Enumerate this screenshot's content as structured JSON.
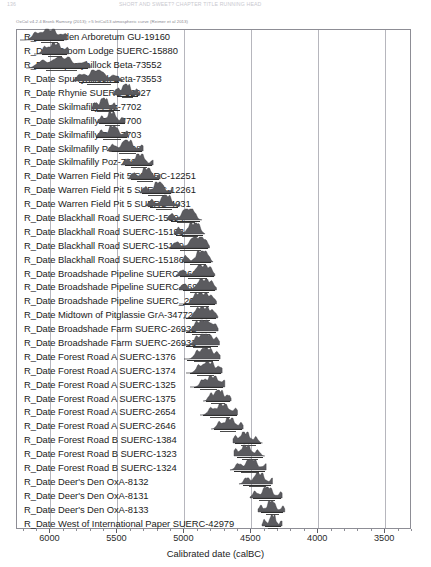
{
  "running_header": {
    "left": "136",
    "center": "SHORT AND SWEET? CHAPTER TITLE RUNNING HEAD"
  },
  "caption": "OxCal v4.2.4 Bronk Ramsey (2013); r:5 IntCal13 atmospheric curve (Reimer et al 2013)",
  "axis": {
    "title": "Calibrated date (calBC)",
    "tick_labels": [
      "6000",
      "5500",
      "5000",
      "4500",
      "4000",
      "3500"
    ],
    "min": 6250,
    "max": 3300,
    "direction": "descending"
  },
  "chart_data": {
    "type": "bar",
    "xlabel": "Calibrated date (calBC)",
    "ylabel": "",
    "xlim": [
      6250,
      3300
    ],
    "grid": true,
    "legend": "none",
    "categories": [
      "R_Date Aden Arboretum GU-19160",
      "R_Date Broom Lodge SUERC-15880",
      "R_Date Spurryhillock Beta-73552",
      "R_Date Spurryhillock Beta-73553",
      "R_Date Rhynie SUERC-52927",
      "R_Date Skilmafilly Poz-7702",
      "R_Date Skilmafilly Poz-7700",
      "R_Date Skilmafilly Poz-7703",
      "R_Date Skilmafilly Poz-7701",
      "R_Date Skilmafilly Poz-7698",
      "R_Date Skilmafilly Poz-7699",
      "R_Date Warren Field Pit 5 SUERC-12251",
      "R_Date Warren Field Pit 5 SUERC-12261",
      "R_Date Warren Field Pit 5 SUERC-4031",
      "R_Date Blackhall Road SUERC-15194",
      "R_Date Blackhall Road SUERC-15193",
      "R_Date Blackhall Road SUERC-15189",
      "R_Date Blackhall Road SUERC-15186",
      "R_Date Broadshade Pipeline SUERC-26932",
      "R_Date Broadshade Pipeline SUERC-26933",
      "R_Date Broadshade Pipeline SUERC_26934",
      "R_Date Midtown of Pitglassie GrA-34772",
      "R_Date Broadshade Farm SUERC-26932",
      "R_Date Broadshade Farm SUERC-26933",
      "R_Date Forest Road A SUERC-1376",
      "R_Date Forest Road A SUERC-1374",
      "R_Date Forest Road A SUERC-1325",
      "R_Date Forest Road A SUERC-1375",
      "R_Date Forest Road A SUERC-2654",
      "R_Date Forest Road A SUERC-2646",
      "R_Date Forest Road B SUERC-1384",
      "R_Date Forest Road B SUERC-1323",
      "R_Date Forest Road B SUERC-1324",
      "R_Date Deer's Den OxA-8132",
      "R_Date Deer's Den OxA-8131",
      "R_Date Deer's Den OxA-8133",
      "R_Date West of International Paper SUERC-42979"
    ],
    "distributions": [
      {
        "label": "R_Date Aden Arboretum GU-19160",
        "peak": 6010,
        "lo": 6230,
        "hi": 5880,
        "bar_lo": 6120,
        "bar_hi": 5900
      },
      {
        "label": "R_Date Broom Lodge SUERC-15880",
        "peak": 5960,
        "lo": 6120,
        "hi": 5860,
        "bar_lo": 6060,
        "bar_hi": 5880
      },
      {
        "label": "R_Date Spurryhillock Beta-73552",
        "peak": 5910,
        "lo": 6180,
        "hi": 5700,
        "bar_lo": 6120,
        "bar_hi": 5720
      },
      {
        "label": "R_Date Spurryhillock Beta-73553",
        "peak": 5650,
        "lo": 5830,
        "hi": 5460,
        "bar_lo": 5790,
        "bar_hi": 5490
      },
      {
        "label": "R_Date Rhynie SUERC-52927",
        "peak": 5430,
        "lo": 5530,
        "hi": 5330,
        "bar_lo": 5500,
        "bar_hi": 5350
      },
      {
        "label": "R_Date Skilmafilly Poz-7702",
        "peak": 5600,
        "lo": 5690,
        "hi": 5500,
        "bar_lo": 5700,
        "bar_hi": 5480
      },
      {
        "label": "R_Date Skilmafilly Poz-7700",
        "peak": 5540,
        "lo": 5650,
        "hi": 5440,
        "bar_lo": 5640,
        "bar_hi": 5440
      },
      {
        "label": "R_Date Skilmafilly Poz-7703",
        "peak": 5530,
        "lo": 5660,
        "hi": 5420,
        "bar_lo": 5660,
        "bar_hi": 5430
      },
      {
        "label": "R_Date Skilmafilly Poz-7698",
        "peak": 5430,
        "lo": 5580,
        "hi": 5310,
        "bar_lo": 5540,
        "bar_hi": 5320
      },
      {
        "label": "R_Date Skilmafilly Poz-7699",
        "peak": 5330,
        "lo": 5470,
        "hi": 5230,
        "bar_lo": 5440,
        "bar_hi": 5240
      },
      {
        "label": "R_Date Warren Field Pit 5 SUERC-12251",
        "peak": 5280,
        "lo": 5420,
        "hi": 5180,
        "bar_lo": 5400,
        "bar_hi": 5190
      },
      {
        "label": "R_Date Warren Field Pit 5 SUERC-12261",
        "peak": 5190,
        "lo": 5330,
        "hi": 5090,
        "bar_lo": 5320,
        "bar_hi": 5100
      },
      {
        "label": "R_Date Warren Field Pit 5 SUERC-4031",
        "peak": 5140,
        "lo": 5290,
        "hi": 5040,
        "bar_lo": 5260,
        "bar_hi": 5050
      },
      {
        "label": "R_Date Blackhall Road SUERC-15194",
        "peak": 4980,
        "lo": 5130,
        "hi": 4870,
        "bar_lo": 5100,
        "bar_hi": 4880
      },
      {
        "label": "R_Date Blackhall Road SUERC-15193",
        "peak": 4940,
        "lo": 5080,
        "hi": 4850,
        "bar_lo": 5060,
        "bar_hi": 4860
      },
      {
        "label": "R_Date Blackhall Road SUERC-15189",
        "peak": 4910,
        "lo": 5120,
        "hi": 4810,
        "bar_lo": 5090,
        "bar_hi": 4820
      },
      {
        "label": "R_Date Blackhall Road SUERC-15186",
        "peak": 4880,
        "lo": 5020,
        "hi": 4790,
        "bar_lo": 5000,
        "bar_hi": 4800
      },
      {
        "label": "R_Date Broadshade Pipeline SUERC-26932",
        "peak": 4870,
        "lo": 5060,
        "hi": 4770,
        "bar_lo": 5030,
        "bar_hi": 4780
      },
      {
        "label": "R_Date Broadshade Pipeline SUERC-26933",
        "peak": 4860,
        "lo": 5040,
        "hi": 4760,
        "bar_lo": 5010,
        "bar_hi": 4770
      },
      {
        "label": "R_Date Broadshade Pipeline SUERC_26934",
        "peak": 4860,
        "lo": 5040,
        "hi": 4760,
        "bar_lo": 5010,
        "bar_hi": 4770
      },
      {
        "label": "R_Date Midtown of Pitglassie GrA-34772",
        "peak": 4850,
        "lo": 5010,
        "hi": 4750,
        "bar_lo": 4990,
        "bar_hi": 4760
      },
      {
        "label": "R_Date Broadshade Farm SUERC-26932",
        "peak": 4850,
        "lo": 5020,
        "hi": 4750,
        "bar_lo": 4990,
        "bar_hi": 4760
      },
      {
        "label": "R_Date Broadshade Farm SUERC-26933",
        "peak": 4840,
        "lo": 5020,
        "hi": 4740,
        "bar_lo": 4990,
        "bar_hi": 4750
      },
      {
        "label": "R_Date Forest Road A SUERC-1376",
        "peak": 4830,
        "lo": 5000,
        "hi": 4730,
        "bar_lo": 4980,
        "bar_hi": 4740
      },
      {
        "label": "R_Date Forest Road A SUERC-1374",
        "peak": 4820,
        "lo": 4990,
        "hi": 4720,
        "bar_lo": 4960,
        "bar_hi": 4730
      },
      {
        "label": "R_Date Forest Road A SUERC-1325",
        "peak": 4790,
        "lo": 4960,
        "hi": 4700,
        "bar_lo": 4930,
        "bar_hi": 4710
      },
      {
        "label": "R_Date Forest Road A SUERC-1375",
        "peak": 4740,
        "lo": 4860,
        "hi": 4650,
        "bar_lo": 4840,
        "bar_hi": 4660
      },
      {
        "label": "R_Date Forest Road A SUERC-2654",
        "peak": 4710,
        "lo": 4880,
        "hi": 4600,
        "bar_lo": 4860,
        "bar_hi": 4610
      },
      {
        "label": "R_Date Forest Road A SUERC-2646",
        "peak": 4660,
        "lo": 4800,
        "hi": 4560,
        "bar_lo": 4780,
        "bar_hi": 4570
      },
      {
        "label": "R_Date Forest Road B SUERC-1384",
        "peak": 4550,
        "lo": 4640,
        "hi": 4420,
        "bar_lo": 4620,
        "bar_hi": 4430
      },
      {
        "label": "R_Date Forest Road B SUERC-1323",
        "peak": 4540,
        "lo": 4630,
        "hi": 4400,
        "bar_lo": 4610,
        "bar_hi": 4410
      },
      {
        "label": "R_Date Forest Road B SUERC-1324",
        "peak": 4500,
        "lo": 4660,
        "hi": 4390,
        "bar_lo": 4630,
        "bar_hi": 4400
      },
      {
        "label": "R_Date Deer's Den OxA-8132",
        "peak": 4440,
        "lo": 4590,
        "hi": 4340,
        "bar_lo": 4560,
        "bar_hi": 4350
      },
      {
        "label": "R_Date Deer's Den OxA-8131",
        "peak": 4380,
        "lo": 4510,
        "hi": 4270,
        "bar_lo": 4490,
        "bar_hi": 4280
      },
      {
        "label": "R_Date Deer's Den OxA-8133",
        "peak": 4350,
        "lo": 4450,
        "hi": 4250,
        "bar_lo": 4430,
        "bar_hi": 4260
      },
      {
        "label": "R_Date West of International Paper SUERC-42979",
        "peak": 4340,
        "lo": 4420,
        "hi": 4270,
        "bar_lo": 4400,
        "bar_hi": 4280
      }
    ]
  }
}
